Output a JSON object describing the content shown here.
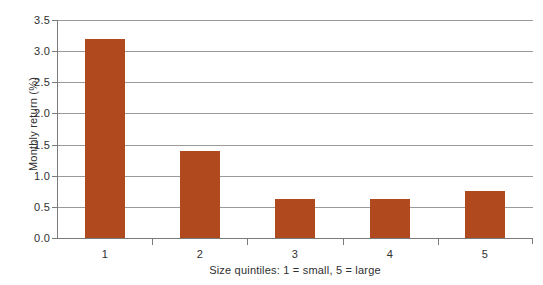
{
  "chart_data": {
    "type": "bar",
    "title": "",
    "subtitle": "",
    "categories": [
      "1",
      "2",
      "3",
      "4",
      "5"
    ],
    "values": [
      3.2,
      1.4,
      0.63,
      0.63,
      0.75
    ],
    "series": [
      {
        "name": "Monthly return",
        "values": [
          3.2,
          1.4,
          0.63,
          0.63,
          0.75
        ]
      }
    ],
    "xlabel": "Size quintiles: 1 = small, 5 = large",
    "ylabel": "Monthly return (%)",
    "ylim": [
      0.0,
      3.5
    ],
    "ytick_labels": [
      "0.0",
      "0.5",
      "1.0",
      "1.5",
      "2.0",
      "2.5",
      "3.0",
      "3.5"
    ],
    "ytick_values": [
      0.0,
      0.5,
      1.0,
      1.5,
      2.0,
      2.5,
      3.0,
      3.5
    ],
    "grid": true,
    "grid_axis": "y",
    "legend": false,
    "legend_position": "none",
    "bar_color": "#b0491e",
    "axis_color": "#7b7b7b",
    "grid_color": "#9a9a9a",
    "text_color": "#2f2f2f",
    "background_color": "#ffffff"
  }
}
